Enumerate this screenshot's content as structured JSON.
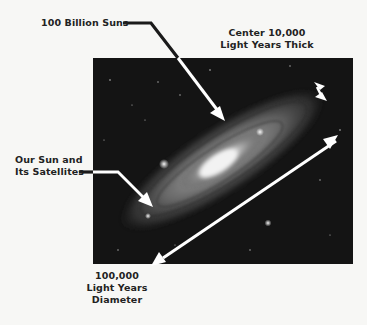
{
  "figure": {
    "labels": {
      "billion_suns": "100 Billion Suns",
      "center_thickness": [
        "Center 10,000",
        "Light Years Thick"
      ],
      "our_sun": [
        "Our Sun and",
        "Its Satellites"
      ],
      "diameter": [
        "100,000",
        "Light Years",
        "Diameter"
      ]
    },
    "image": {
      "subject": "spiral galaxy photograph",
      "background_color": "#111111"
    },
    "arrows": [
      {
        "name": "billion-suns-pointer",
        "color": "#ffffff",
        "leader_color": "#1a1a1a"
      },
      {
        "name": "thickness-double-arrow",
        "color": "#ffffff"
      },
      {
        "name": "sun-pointer",
        "color": "#ffffff",
        "leader_color": "#1a1a1a"
      },
      {
        "name": "diameter-double-arrow",
        "color": "#ffffff"
      }
    ]
  }
}
